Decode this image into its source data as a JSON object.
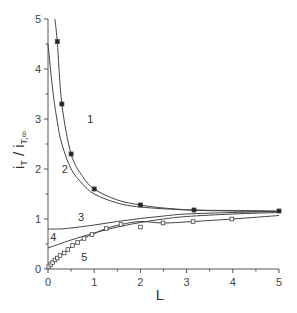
{
  "chart_data": {
    "type": "line",
    "title": "",
    "xlabel": "L",
    "ylabel": "i_T / i_T,∞",
    "xlim": [
      0,
      5
    ],
    "ylim": [
      0,
      5
    ],
    "xticks": [
      "0",
      "1",
      "2",
      "3",
      "4",
      "5"
    ],
    "yticks": [
      "0",
      "1",
      "2",
      "3",
      "4",
      "5"
    ],
    "grid": false,
    "legend": "none (curves labeled inline 1–5)",
    "series": [
      {
        "name": "1",
        "style": "line with filled square markers",
        "curve": [
          [
            0.15,
            5.0
          ],
          [
            0.2,
            4.55
          ],
          [
            0.3,
            3.3
          ],
          [
            0.5,
            2.3
          ],
          [
            0.75,
            1.85
          ],
          [
            1.0,
            1.6
          ],
          [
            1.5,
            1.38
          ],
          [
            2.0,
            1.28
          ],
          [
            2.5,
            1.22
          ],
          [
            3.16,
            1.18
          ],
          [
            4.0,
            1.17
          ],
          [
            5.0,
            1.16
          ]
        ],
        "markers": [
          [
            0.2,
            4.55
          ],
          [
            0.3,
            3.3
          ],
          [
            0.5,
            2.3
          ],
          [
            1.0,
            1.6
          ],
          [
            2.0,
            1.28
          ],
          [
            3.16,
            1.18
          ],
          [
            5.0,
            1.16
          ]
        ]
      },
      {
        "name": "2",
        "style": "line",
        "curve": [
          [
            0.0,
            4.5
          ],
          [
            0.1,
            3.6
          ],
          [
            0.2,
            2.95
          ],
          [
            0.3,
            2.5
          ],
          [
            0.5,
            2.0
          ],
          [
            0.75,
            1.7
          ],
          [
            1.0,
            1.5
          ],
          [
            1.5,
            1.32
          ],
          [
            2.0,
            1.24
          ],
          [
            3.0,
            1.18
          ],
          [
            4.0,
            1.16
          ],
          [
            5.0,
            1.15
          ]
        ]
      },
      {
        "name": "3",
        "style": "line",
        "curve": [
          [
            0.0,
            0.8
          ],
          [
            0.25,
            0.8
          ],
          [
            0.5,
            0.82
          ],
          [
            1.0,
            0.88
          ],
          [
            1.5,
            0.95
          ],
          [
            2.0,
            1.01
          ],
          [
            2.5,
            1.06
          ],
          [
            3.0,
            1.1
          ],
          [
            4.0,
            1.13
          ],
          [
            5.0,
            1.15
          ]
        ]
      },
      {
        "name": "4",
        "style": "line",
        "curve": [
          [
            0.0,
            0.42
          ],
          [
            0.25,
            0.5
          ],
          [
            0.5,
            0.58
          ],
          [
            1.0,
            0.72
          ],
          [
            1.5,
            0.84
          ],
          [
            2.0,
            0.93
          ],
          [
            2.5,
            1.0
          ],
          [
            3.0,
            1.05
          ],
          [
            4.0,
            1.1
          ],
          [
            5.0,
            1.13
          ]
        ]
      },
      {
        "name": "5",
        "style": "line with open square markers",
        "curve": [
          [
            0.0,
            0.0
          ],
          [
            0.1,
            0.12
          ],
          [
            0.2,
            0.22
          ],
          [
            0.35,
            0.32
          ],
          [
            0.5,
            0.44
          ],
          [
            0.75,
            0.6
          ],
          [
            1.0,
            0.71
          ],
          [
            1.26,
            0.81
          ],
          [
            1.58,
            0.89
          ],
          [
            2.0,
            0.95
          ],
          [
            2.5,
            0.92
          ],
          [
            3.14,
            0.95
          ],
          [
            4.0,
            1.0
          ],
          [
            5.0,
            1.07
          ]
        ],
        "markers": [
          [
            0.015,
            0.05
          ],
          [
            0.06,
            0.09
          ],
          [
            0.1,
            0.13
          ],
          [
            0.15,
            0.18
          ],
          [
            0.2,
            0.22
          ],
          [
            0.26,
            0.27
          ],
          [
            0.35,
            0.32
          ],
          [
            0.43,
            0.39
          ],
          [
            0.53,
            0.47
          ],
          [
            0.64,
            0.53
          ],
          [
            0.78,
            0.61
          ],
          [
            0.95,
            0.69
          ],
          [
            1.26,
            0.81
          ],
          [
            1.58,
            0.89
          ],
          [
            2.0,
            0.84
          ],
          [
            2.49,
            0.92
          ],
          [
            3.14,
            0.95
          ],
          [
            3.98,
            1.0
          ]
        ]
      }
    ],
    "annotations": [
      {
        "text": "1",
        "x": 0.85,
        "y": 3.0
      },
      {
        "text": "2",
        "x": 0.3,
        "y": 2.0
      },
      {
        "text": "3",
        "x": 0.65,
        "y": 1.05
      },
      {
        "text": "4",
        "x": 0.05,
        "y": 0.65
      },
      {
        "text": "5",
        "x": 0.72,
        "y": 0.25
      }
    ]
  }
}
